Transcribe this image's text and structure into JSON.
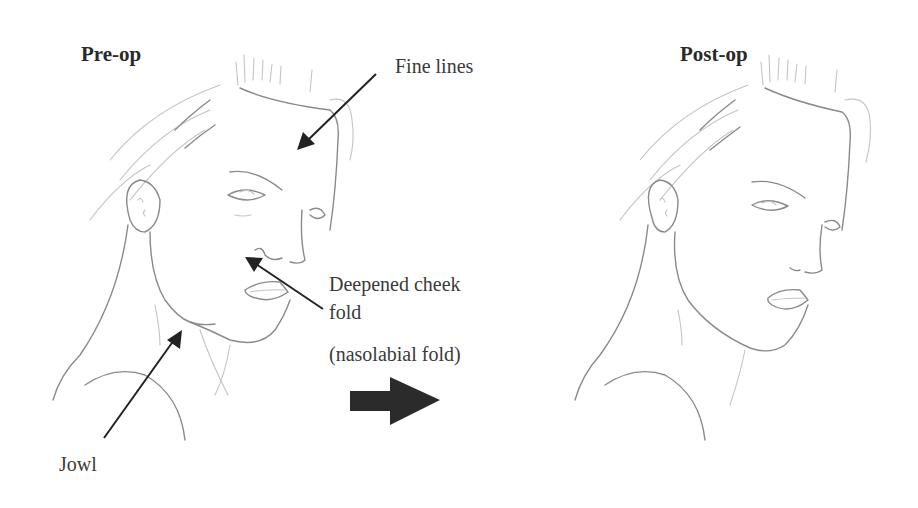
{
  "figure": {
    "panels": [
      {
        "id": "pre",
        "title": "Pre-op"
      },
      {
        "id": "post",
        "title": "Post-op"
      }
    ],
    "annotations": [
      {
        "id": "fine-lines",
        "text": "Fine lines"
      },
      {
        "id": "cheek-fold",
        "text_line1": "Deepened cheek",
        "text_line2": "fold"
      },
      {
        "id": "nasolabial",
        "text": "(nasolabial fold)"
      },
      {
        "id": "jowl",
        "text": "Jowl"
      }
    ],
    "transition_arrow": "right-arrow",
    "colors": {
      "sketch": "#8a8a8a",
      "arrow": "#222222",
      "text": "#3a3a3a"
    }
  }
}
